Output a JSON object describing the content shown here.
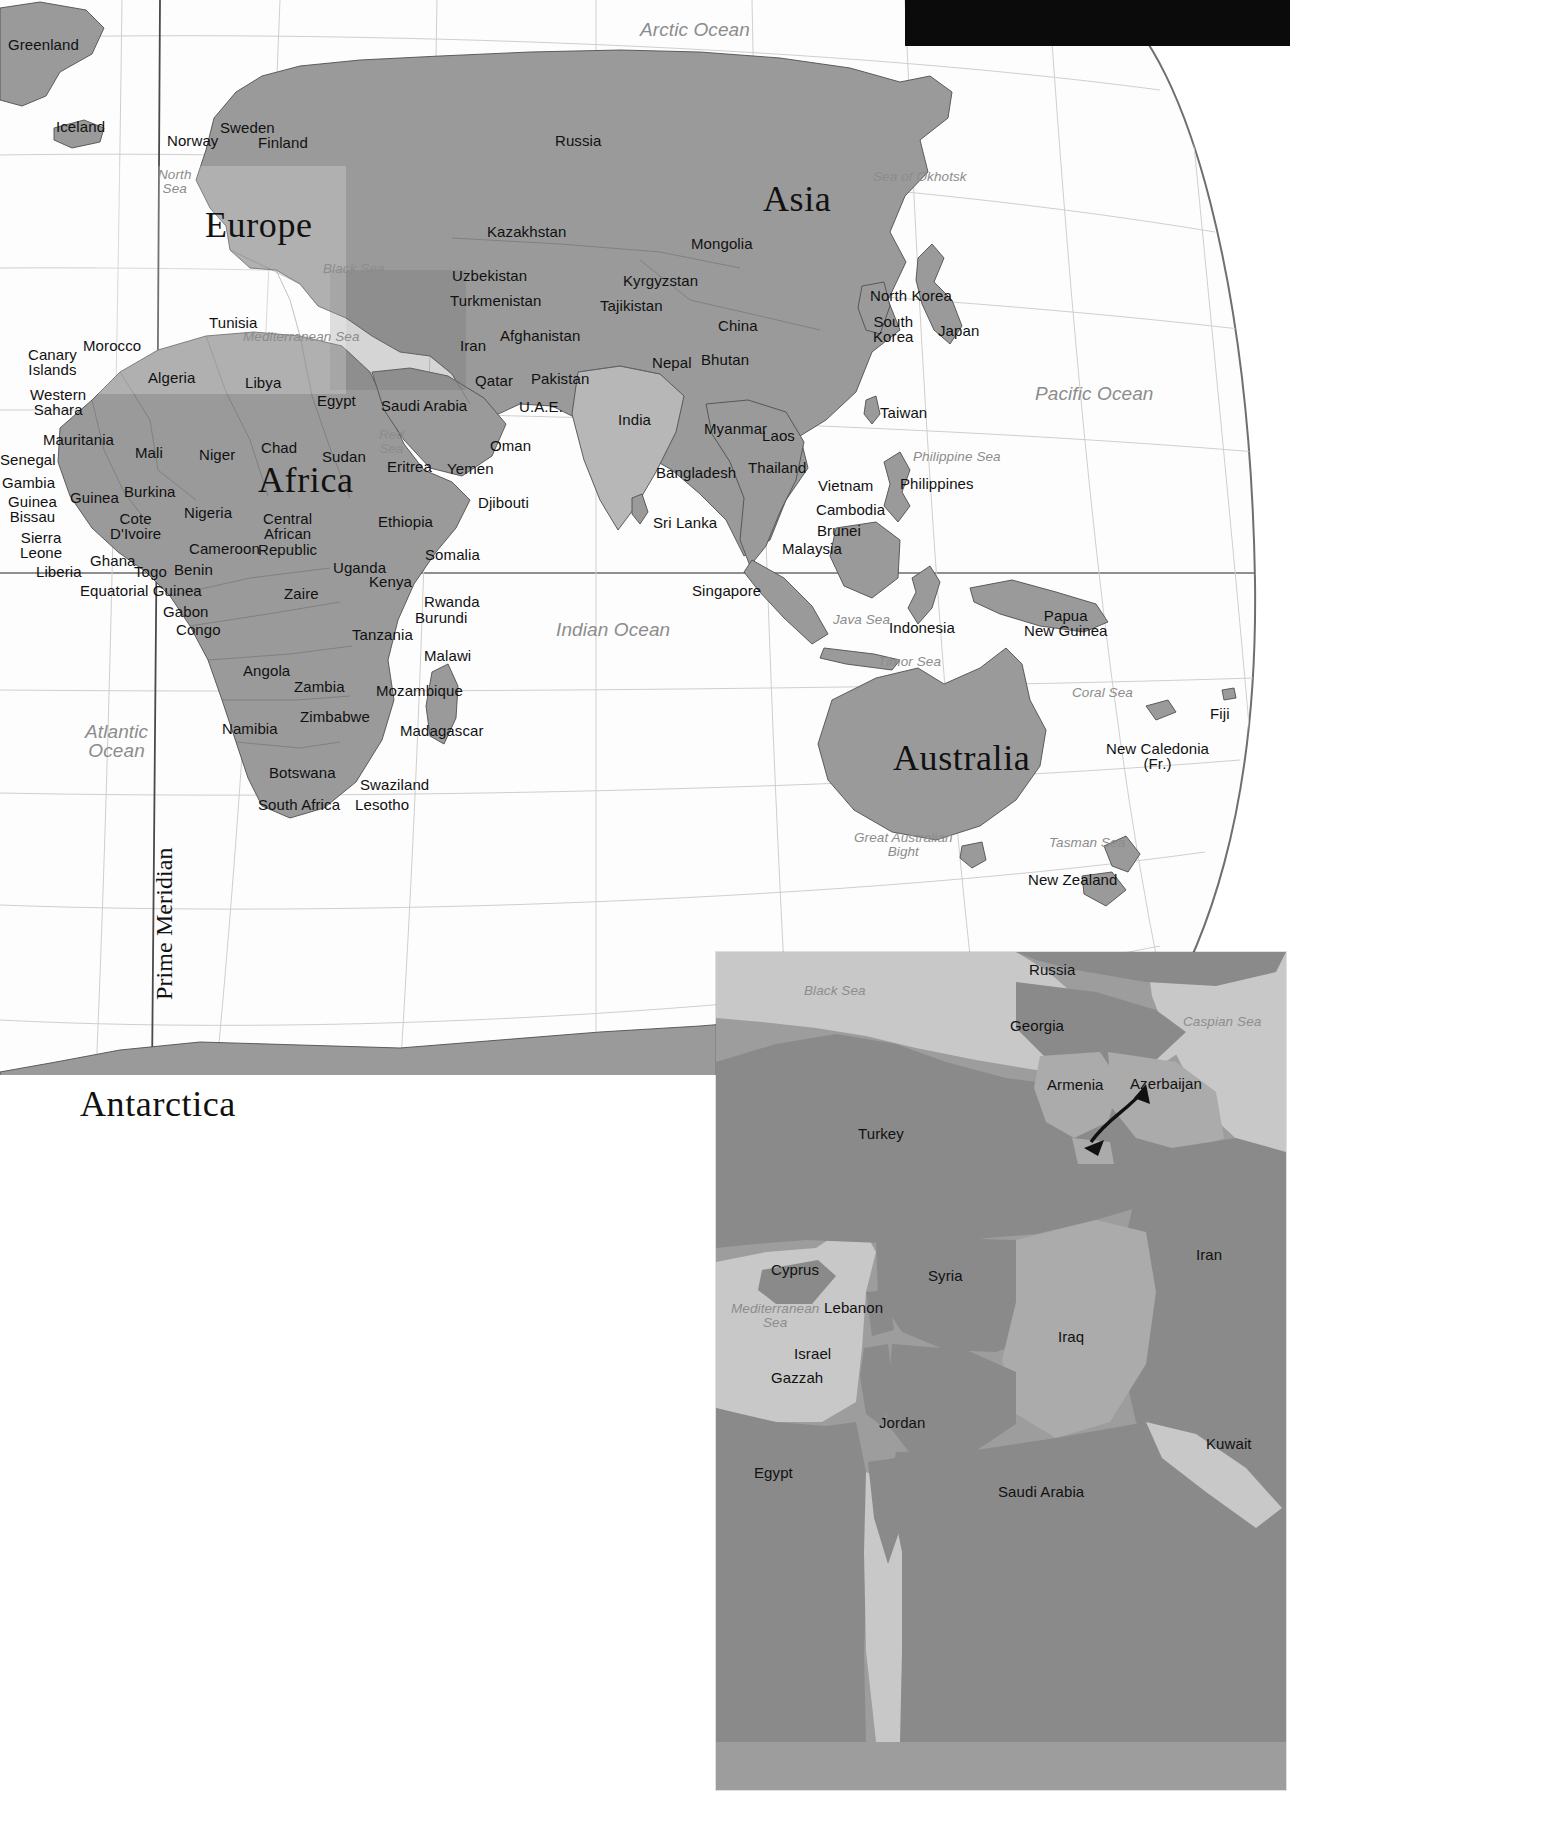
{
  "document": {
    "kind": "world-map-plate",
    "main_map_title": "",
    "projection_note": "Prime Meridian"
  },
  "main_map": {
    "continents": [
      {
        "name": "Europe",
        "x": 205,
        "y": 207
      },
      {
        "name": "Asia",
        "x": 763,
        "y": 181
      },
      {
        "name": "Africa",
        "x": 258,
        "y": 462
      },
      {
        "name": "Australia",
        "x": 893,
        "y": 740
      },
      {
        "name": "Antarctica",
        "x": 80,
        "y": 1086
      }
    ],
    "oceans": [
      {
        "name": "Arctic Ocean",
        "x": 640,
        "y": 20,
        "align": "left"
      },
      {
        "name": "Pacific Ocean",
        "x": 1035,
        "y": 384,
        "align": "left"
      },
      {
        "name": "Indian Ocean",
        "x": 556,
        "y": 620,
        "align": "left"
      },
      {
        "name": "Atlantic\nOcean",
        "x": 85,
        "y": 722,
        "align": "center"
      }
    ],
    "seas": [
      {
        "name": "North\nSea",
        "x": 158,
        "y": 168
      },
      {
        "name": "Black Sea",
        "x": 323,
        "y": 262
      },
      {
        "name": "Mediterranean Sea",
        "x": 243,
        "y": 330
      },
      {
        "name": "Red\nSea",
        "x": 379,
        "y": 428
      },
      {
        "name": "Sea of Okhotsk",
        "x": 873,
        "y": 170
      },
      {
        "name": "Philippine Sea",
        "x": 913,
        "y": 450
      },
      {
        "name": "Java Sea",
        "x": 833,
        "y": 613
      },
      {
        "name": "Timor Sea",
        "x": 878,
        "y": 655
      },
      {
        "name": "Coral Sea",
        "x": 1072,
        "y": 686
      },
      {
        "name": "Tasman Sea",
        "x": 1049,
        "y": 836
      },
      {
        "name": "Great Australian\nBight",
        "x": 854,
        "y": 831
      }
    ],
    "countries": [
      {
        "name": "Greenland",
        "x": 8,
        "y": 37,
        "size": "country"
      },
      {
        "name": "Iceland",
        "x": 56,
        "y": 119,
        "size": "country"
      },
      {
        "name": "Norway",
        "x": 167,
        "y": 133,
        "size": "country"
      },
      {
        "name": "Sweden",
        "x": 220,
        "y": 120,
        "size": "country"
      },
      {
        "name": "Finland",
        "x": 258,
        "y": 135,
        "size": "country"
      },
      {
        "name": "Russia",
        "x": 555,
        "y": 133,
        "size": "country"
      },
      {
        "name": "Kazakhstan",
        "x": 487,
        "y": 224,
        "size": "country"
      },
      {
        "name": "Mongolia",
        "x": 691,
        "y": 236,
        "size": "country"
      },
      {
        "name": "Uzbekistan",
        "x": 452,
        "y": 268,
        "size": "country"
      },
      {
        "name": "Kyrgyzstan",
        "x": 623,
        "y": 273,
        "size": "country"
      },
      {
        "name": "Turkmenistan",
        "x": 450,
        "y": 293,
        "size": "country"
      },
      {
        "name": "Tajikistan",
        "x": 600,
        "y": 298,
        "size": "country"
      },
      {
        "name": "China",
        "x": 718,
        "y": 318,
        "size": "country"
      },
      {
        "name": "North Korea",
        "x": 870,
        "y": 288,
        "size": "country"
      },
      {
        "name": "South\nKorea",
        "x": 873,
        "y": 314,
        "size": "country"
      },
      {
        "name": "Japan",
        "x": 938,
        "y": 323,
        "size": "country"
      },
      {
        "name": "Afghanistan",
        "x": 500,
        "y": 328,
        "size": "country"
      },
      {
        "name": "Iran",
        "x": 460,
        "y": 338,
        "size": "country"
      },
      {
        "name": "Nepal",
        "x": 652,
        "y": 355,
        "size": "country"
      },
      {
        "name": "Bhutan",
        "x": 701,
        "y": 352,
        "size": "country"
      },
      {
        "name": "Pakistan",
        "x": 531,
        "y": 371,
        "size": "country"
      },
      {
        "name": "Qatar",
        "x": 475,
        "y": 373,
        "size": "country"
      },
      {
        "name": "U.A.E.",
        "x": 519,
        "y": 399,
        "size": "country"
      },
      {
        "name": "Saudi Arabia",
        "x": 381,
        "y": 398,
        "size": "country"
      },
      {
        "name": "Egypt",
        "x": 317,
        "y": 393,
        "size": "country"
      },
      {
        "name": "India",
        "x": 618,
        "y": 412,
        "size": "country"
      },
      {
        "name": "Taiwan",
        "x": 880,
        "y": 405,
        "size": "country"
      },
      {
        "name": "Oman",
        "x": 490,
        "y": 438,
        "size": "country"
      },
      {
        "name": "Myanmar",
        "x": 704,
        "y": 421,
        "size": "country"
      },
      {
        "name": "Laos",
        "x": 762,
        "y": 428,
        "size": "country"
      },
      {
        "name": "Yemen",
        "x": 447,
        "y": 461,
        "size": "country"
      },
      {
        "name": "Bangladesh",
        "x": 656,
        "y": 465,
        "size": "country"
      },
      {
        "name": "Thailand",
        "x": 748,
        "y": 460,
        "size": "country"
      },
      {
        "name": "Vietnam",
        "x": 818,
        "y": 478,
        "size": "country"
      },
      {
        "name": "Philippines",
        "x": 900,
        "y": 476,
        "size": "country"
      },
      {
        "name": "Djibouti",
        "x": 478,
        "y": 495,
        "size": "country"
      },
      {
        "name": "Cambodia",
        "x": 816,
        "y": 502,
        "size": "country"
      },
      {
        "name": "Sri Lanka",
        "x": 653,
        "y": 515,
        "size": "country"
      },
      {
        "name": "Brunei",
        "x": 817,
        "y": 523,
        "size": "country"
      },
      {
        "name": "Malaysia",
        "x": 782,
        "y": 541,
        "size": "country"
      },
      {
        "name": "Singapore",
        "x": 692,
        "y": 583,
        "size": "country"
      },
      {
        "name": "Indonesia",
        "x": 889,
        "y": 620,
        "size": "country"
      },
      {
        "name": "Papua\nNew Guinea",
        "x": 1024,
        "y": 608,
        "size": "country"
      },
      {
        "name": "Fiji",
        "x": 1210,
        "y": 706,
        "size": "country"
      },
      {
        "name": "New Caledonia\n(Fr.)",
        "x": 1106,
        "y": 741,
        "size": "country"
      },
      {
        "name": "New Zealand",
        "x": 1028,
        "y": 872,
        "size": "country"
      },
      {
        "name": "Tunisia",
        "x": 209,
        "y": 315,
        "size": "country"
      },
      {
        "name": "Morocco",
        "x": 83,
        "y": 338,
        "size": "country"
      },
      {
        "name": "Canary\nIslands",
        "x": 28,
        "y": 347,
        "size": "country"
      },
      {
        "name": "Algeria",
        "x": 148,
        "y": 370,
        "size": "country"
      },
      {
        "name": "Libya",
        "x": 245,
        "y": 375,
        "size": "country"
      },
      {
        "name": "Western\nSahara",
        "x": 30,
        "y": 387,
        "size": "country"
      },
      {
        "name": "Mauritania",
        "x": 43,
        "y": 432,
        "size": "country"
      },
      {
        "name": "Mali",
        "x": 135,
        "y": 445,
        "size": "country"
      },
      {
        "name": "Niger",
        "x": 199,
        "y": 447,
        "size": "country"
      },
      {
        "name": "Chad",
        "x": 261,
        "y": 440,
        "size": "country"
      },
      {
        "name": "Sudan",
        "x": 322,
        "y": 449,
        "size": "country"
      },
      {
        "name": "Eritrea",
        "x": 387,
        "y": 459,
        "size": "country"
      },
      {
        "name": "Senegal",
        "x": 0,
        "y": 452,
        "size": "country"
      },
      {
        "name": "Gambia",
        "x": 2,
        "y": 475,
        "size": "country"
      },
      {
        "name": "Guinea\nBissau",
        "x": 8,
        "y": 494,
        "size": "country"
      },
      {
        "name": "Guinea",
        "x": 70,
        "y": 490,
        "size": "country"
      },
      {
        "name": "Burkina",
        "x": 124,
        "y": 484,
        "size": "country"
      },
      {
        "name": "Nigeria",
        "x": 184,
        "y": 505,
        "size": "country"
      },
      {
        "name": "Cote\nD'Ivoire",
        "x": 110,
        "y": 511,
        "size": "country"
      },
      {
        "name": "Central\nAfrican\nRepublic",
        "x": 258,
        "y": 511,
        "size": "country"
      },
      {
        "name": "Ethiopia",
        "x": 378,
        "y": 514,
        "size": "country"
      },
      {
        "name": "Sierra\nLeone",
        "x": 20,
        "y": 530,
        "size": "country"
      },
      {
        "name": "Cameroon",
        "x": 189,
        "y": 541,
        "size": "country"
      },
      {
        "name": "Somalia",
        "x": 425,
        "y": 547,
        "size": "country"
      },
      {
        "name": "Ghana",
        "x": 90,
        "y": 553,
        "size": "country"
      },
      {
        "name": "Liberia",
        "x": 36,
        "y": 564,
        "size": "country"
      },
      {
        "name": "Togo",
        "x": 134,
        "y": 564,
        "size": "country"
      },
      {
        "name": "Benin",
        "x": 174,
        "y": 562,
        "size": "country"
      },
      {
        "name": "Uganda",
        "x": 333,
        "y": 560,
        "size": "country"
      },
      {
        "name": "Kenya",
        "x": 369,
        "y": 574,
        "size": "country"
      },
      {
        "name": "Equatorial Guinea",
        "x": 80,
        "y": 583,
        "size": "country"
      },
      {
        "name": "Rwanda",
        "x": 424,
        "y": 594,
        "size": "country"
      },
      {
        "name": "Zaire",
        "x": 284,
        "y": 586,
        "size": "country"
      },
      {
        "name": "Gabon",
        "x": 163,
        "y": 604,
        "size": "country"
      },
      {
        "name": "Burundi",
        "x": 415,
        "y": 610,
        "size": "country"
      },
      {
        "name": "Congo",
        "x": 176,
        "y": 622,
        "size": "country"
      },
      {
        "name": "Tanzania",
        "x": 352,
        "y": 627,
        "size": "country"
      },
      {
        "name": "Malawi",
        "x": 424,
        "y": 648,
        "size": "country"
      },
      {
        "name": "Angola",
        "x": 243,
        "y": 663,
        "size": "country"
      },
      {
        "name": "Zambia",
        "x": 294,
        "y": 679,
        "size": "country"
      },
      {
        "name": "Mozambique",
        "x": 376,
        "y": 683,
        "size": "country"
      },
      {
        "name": "Zimbabwe",
        "x": 300,
        "y": 709,
        "size": "country"
      },
      {
        "name": "Namibia",
        "x": 222,
        "y": 721,
        "size": "country"
      },
      {
        "name": "Madagascar",
        "x": 400,
        "y": 723,
        "size": "country"
      },
      {
        "name": "Botswana",
        "x": 269,
        "y": 765,
        "size": "country"
      },
      {
        "name": "Swaziland",
        "x": 360,
        "y": 777,
        "size": "country"
      },
      {
        "name": "South Africa",
        "x": 258,
        "y": 797,
        "size": "country"
      },
      {
        "name": "Lesotho",
        "x": 355,
        "y": 797,
        "size": "country"
      }
    ],
    "meridian_label": "Prime Meridian"
  },
  "inset_map": {
    "region": "Middle East / Caucasus",
    "countries": [
      {
        "name": "Russia",
        "x": 313,
        "y": 10,
        "size": "country"
      },
      {
        "name": "Georgia",
        "x": 294,
        "y": 66,
        "size": "country"
      },
      {
        "name": "Armenia",
        "x": 331,
        "y": 125,
        "size": "country"
      },
      {
        "name": "Azerbaijan",
        "x": 414,
        "y": 124,
        "size": "country"
      },
      {
        "name": "Turkey",
        "x": 142,
        "y": 174,
        "size": "country"
      },
      {
        "name": "Cyprus",
        "x": 55,
        "y": 310,
        "size": "country"
      },
      {
        "name": "Syria",
        "x": 212,
        "y": 316,
        "size": "country"
      },
      {
        "name": "Iran",
        "x": 480,
        "y": 295,
        "size": "country"
      },
      {
        "name": "Lebanon",
        "x": 108,
        "y": 348,
        "size": "country"
      },
      {
        "name": "Iraq",
        "x": 342,
        "y": 377,
        "size": "country"
      },
      {
        "name": "Israel",
        "x": 78,
        "y": 394,
        "size": "country"
      },
      {
        "name": "Gazzah",
        "x": 55,
        "y": 418,
        "size": "country"
      },
      {
        "name": "Jordan",
        "x": 163,
        "y": 463,
        "size": "country"
      },
      {
        "name": "Kuwait",
        "x": 490,
        "y": 484,
        "size": "country"
      },
      {
        "name": "Egypt",
        "x": 38,
        "y": 513,
        "size": "country"
      },
      {
        "name": "Saudi Arabia",
        "x": 282,
        "y": 532,
        "size": "country"
      }
    ],
    "seas": [
      {
        "name": "Black Sea",
        "x": 88,
        "y": 32
      },
      {
        "name": "Caspian Sea",
        "x": 467,
        "y": 63
      },
      {
        "name": "Mediterranean\nSea",
        "x": 15,
        "y": 350
      }
    ],
    "annotation": {
      "type": "arrow",
      "label": "azerbaijan-enclave-arrow"
    }
  },
  "colors": {
    "land_mid": "#9a9a9a",
    "land_light": "#b7b7b7",
    "land_dark": "#8a8a8a",
    "ocean": "#fdfdfd",
    "graticule": "#c9c9c9",
    "sea_text": "#8c8c8c",
    "land_text": "#111111",
    "inset_sea": "#c8c8c8",
    "inset_land_a": "#9d9d9d",
    "inset_land_b": "#8a8a8a",
    "inset_land_c": "#ababab"
  }
}
